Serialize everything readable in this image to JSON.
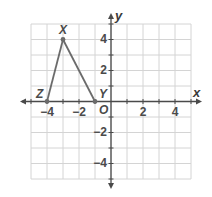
{
  "chart_data": {
    "type": "scatter",
    "title": "",
    "xlabel": "x",
    "ylabel": "y",
    "origin_label": "O",
    "xlim": [
      -5,
      5
    ],
    "ylim": [
      -5,
      5
    ],
    "grid": true,
    "x_ticks": [
      -4,
      -2,
      2,
      4
    ],
    "y_ticks": [
      4,
      2,
      -2,
      -4
    ],
    "x_tick_labels": [
      "−4",
      "−2",
      "2",
      "4"
    ],
    "y_tick_labels": [
      "4",
      "2",
      "−2",
      "−4"
    ],
    "shape": "triangle",
    "points": [
      {
        "label": "X",
        "x": -3,
        "y": 4
      },
      {
        "label": "Y",
        "x": -1,
        "y": 0
      },
      {
        "label": "Z",
        "x": -4,
        "y": 0
      }
    ],
    "segments": [
      [
        "Z",
        "X"
      ],
      [
        "X",
        "Y"
      ]
    ]
  },
  "colors": {
    "grid": "#d4d4d4",
    "axis": "#4a4a4a",
    "triangle": "#6b6b6b"
  }
}
